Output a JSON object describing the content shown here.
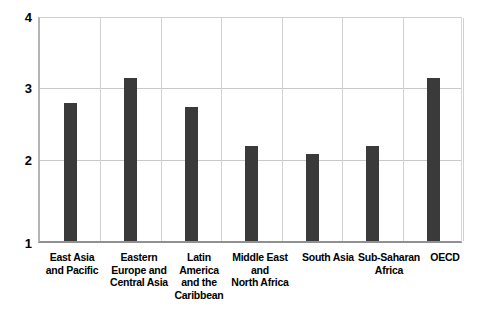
{
  "chart_data": {
    "type": "bar",
    "title": "",
    "subtitle": "",
    "xlabel": "",
    "ylabel": "",
    "categories": [
      "East Asia and Pacific",
      "Eastern Europe and Central Asia",
      "Latin America and the Caribbean",
      "Middle East and North Africa",
      "South Asia",
      "Sub-Saharan Africa",
      "OECD"
    ],
    "values": [
      2.83,
      3.17,
      2.78,
      2.26,
      2.16,
      2.26,
      3.16
    ],
    "ylim": [
      1,
      4
    ],
    "yticks": [
      1,
      2,
      3,
      4
    ],
    "ytick_labels": [
      "1",
      "2",
      "3",
      "4"
    ],
    "grid": true,
    "legend": "none",
    "bar_color": "#3a3a3a",
    "grid_color": "#c8c8c8",
    "axis_color": "#909090",
    "background": "#ffffff"
  },
  "axis": {
    "y_labels": [
      "4",
      "3",
      "2",
      "1"
    ]
  },
  "categories_display": [
    "East Asia\nand Pacific",
    "Eastern\nEurope and\nCentral Asia",
    "Latin\nAmerica\nand the\nCaribbean",
    "Middle East\nand\nNorth Africa",
    "South Asia",
    "Sub-Saharan\nAfrica",
    "OECD"
  ]
}
